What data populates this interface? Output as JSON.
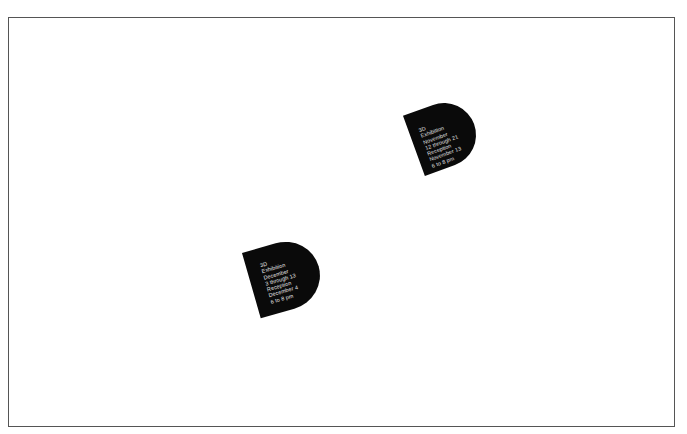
{
  "canvas": {
    "frame_border_color": "#555555",
    "background": "#ffffff"
  },
  "cards": [
    {
      "fill": "#0a0a0a",
      "text_color": "#e8e8e8",
      "lines": [
        "3D",
        "Exhibition",
        "November",
        "12 through 21",
        "Reception",
        "November 13",
        "6 to 8 pm"
      ]
    },
    {
      "fill": "#0a0a0a",
      "text_color": "#e8e8e8",
      "lines": [
        "3D",
        "Exhibition",
        "December",
        "3 through 13",
        "Reception",
        "December 4",
        "6 to 8 pm"
      ]
    }
  ]
}
